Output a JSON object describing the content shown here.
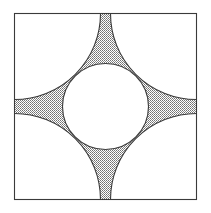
{
  "figure": {
    "title": "Square with inscribed circle and four tangent corner arcs",
    "background_color": "#ffffff",
    "canvas": {
      "width": 211,
      "height": 213
    }
  },
  "geometry": {
    "square": {
      "name": "outer-square",
      "x": 14.5,
      "y": 13.5,
      "width": 182,
      "height": 186,
      "stroke": "#3a3a3a",
      "stroke_width": 1.1,
      "fill": "#ffffff"
    },
    "center_circle": {
      "name": "center-circle",
      "cx": 105.5,
      "cy": 106.5,
      "r": 43,
      "stroke": "#3a3a3a",
      "stroke_width": 1.1,
      "fill": "#ffffff"
    },
    "corner_arcs": {
      "name": "corner-quarter-arcs",
      "radius": 86,
      "stroke": "#3a3a3a",
      "stroke_width": 1.1,
      "fill": "#ffffff",
      "centers": [
        {
          "label": "top-left",
          "cx": 14.5,
          "cy": 13.5
        },
        {
          "label": "top-right",
          "cx": 196.5,
          "cy": 13.5
        },
        {
          "label": "bottom-right",
          "cx": 196.5,
          "cy": 199.5
        },
        {
          "label": "bottom-left",
          "cx": 14.5,
          "cy": 199.5
        }
      ]
    },
    "star_region": {
      "name": "stippled-star-region",
      "fill_pattern": "stipple-dots",
      "stipple_color": "#6e6e6e",
      "stipple_background": "#ffffff",
      "stipple_cell_px": 2,
      "spike_tips": [
        {
          "label": "top",
          "x": 105.5,
          "y": 13.5
        },
        {
          "label": "right",
          "x": 196.5,
          "y": 106.5
        },
        {
          "label": "bottom",
          "x": 105.5,
          "y": 199.5
        },
        {
          "label": "left",
          "x": 14.5,
          "y": 106.5
        }
      ]
    }
  },
  "colors": {
    "line": "#3a3a3a",
    "stipple": "#6e6e6e",
    "paper": "#ffffff"
  }
}
